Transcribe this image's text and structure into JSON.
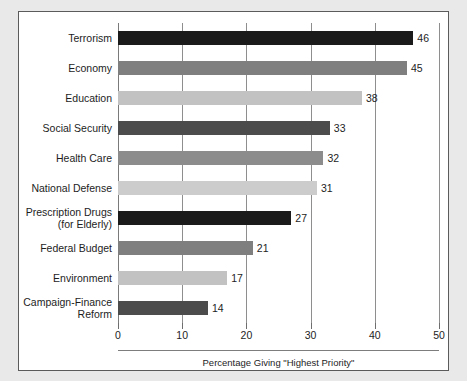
{
  "chart_data": {
    "type": "bar",
    "orientation": "horizontal",
    "title": "",
    "xlabel": "Percentage Giving \"Highest Priority\"",
    "ylabel": "",
    "xlim": [
      0,
      50
    ],
    "xticks": [
      0,
      10,
      20,
      30,
      40,
      50
    ],
    "xtick_labels": [
      "0",
      "10",
      "20",
      "30",
      "40",
      "50"
    ],
    "grid": "vertical",
    "legend": "none",
    "categories": [
      "Terrorism",
      "Economy",
      "Education",
      "Social Security",
      "Health Care",
      "National Defense",
      "Prescription Drugs\n(for Elderly)",
      "Federal Budget",
      "Environment",
      "Campaign-Finance\nReform"
    ],
    "values": [
      46,
      45,
      38,
      33,
      32,
      31,
      27,
      21,
      17,
      14
    ],
    "value_labels": [
      "46",
      "45",
      "38",
      "33",
      "32",
      "31",
      "27",
      "21",
      "17",
      "14"
    ],
    "bar_colors": [
      "#1b1b1b",
      "#7f7f7f",
      "#c2c2c2",
      "#4c4c4c",
      "#8c8c8c",
      "#cccccc",
      "#1b1b1b",
      "#7f7f7f",
      "#c2c2c2",
      "#4c4c4c"
    ]
  },
  "figure": {
    "border_color": "#5b5b5b",
    "background": "#ffffff",
    "page_background": "#e9e9e9",
    "grid_color": "#8e8e8e",
    "text_color": "#1d1d1d"
  }
}
